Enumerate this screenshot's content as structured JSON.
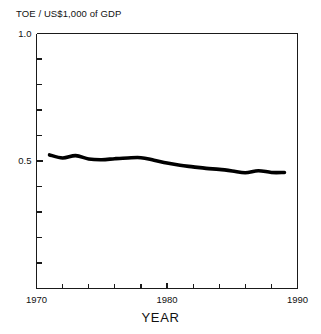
{
  "chart_data": {
    "type": "line",
    "title": "",
    "ylabel": "TOE / US$1,000 of GDP",
    "xlabel": "YEAR",
    "xlim": [
      1970,
      1990
    ],
    "ylim": [
      0.0,
      1.0
    ],
    "grid": false,
    "legend": null,
    "y_tick_labels": [
      "1.0",
      "0.5"
    ],
    "y_tick_values": [
      1.0,
      0.5
    ],
    "y_minor_tick_values": [
      0.9,
      0.8,
      0.7,
      0.6,
      0.4,
      0.3,
      0.2,
      0.1
    ],
    "x_tick_labels": [
      "1970",
      "1980",
      "1990"
    ],
    "x_tick_values": [
      1970,
      1980,
      1990
    ],
    "x_minor_tick_values": [
      1972,
      1974,
      1976,
      1978,
      1982,
      1984,
      1986,
      1988
    ],
    "series": [
      {
        "name": "Energy intensity",
        "color": "#000000",
        "line_width": 3.6,
        "x": [
          1971,
          1972,
          1973,
          1974,
          1975,
          1976,
          1977,
          1978,
          1979,
          1980,
          1981,
          1982,
          1983,
          1984,
          1985,
          1986,
          1987,
          1988,
          1989
        ],
        "values": [
          0.524,
          0.512,
          0.521,
          0.508,
          0.505,
          0.509,
          0.512,
          0.513,
          0.503,
          0.492,
          0.483,
          0.477,
          0.471,
          0.467,
          0.461,
          0.454,
          0.462,
          0.455,
          0.455
        ]
      }
    ]
  },
  "axes": {
    "frame_color": "#1a1a1a",
    "line_color": "#000000"
  }
}
